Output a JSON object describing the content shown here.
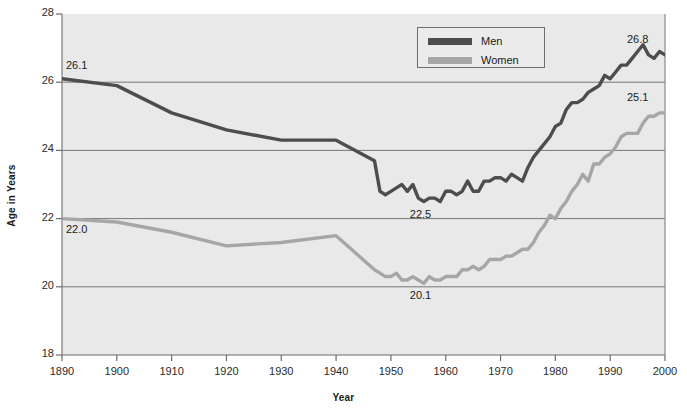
{
  "chart_data": {
    "type": "line",
    "title": "",
    "xlabel": "Year",
    "ylabel": "Age in Years",
    "xlim": [
      1890,
      2000
    ],
    "ylim": [
      18,
      28
    ],
    "grid": true,
    "legend_position": "top-center",
    "xticks": [
      "1890",
      "1900",
      "1910",
      "1920",
      "1930",
      "1940",
      "1950",
      "1960",
      "1970",
      "1980",
      "1990",
      "2000"
    ],
    "yticks": [
      "18",
      "20",
      "22",
      "24",
      "26",
      "28"
    ],
    "annotations": [
      {
        "text": "26.1",
        "x": 1890,
        "y": 26.1,
        "series": "Men"
      },
      {
        "text": "22.5",
        "x": 1956,
        "y": 22.5,
        "series": "Men"
      },
      {
        "text": "26.8",
        "x": 2000,
        "y": 26.8,
        "series": "Men"
      },
      {
        "text": "22.0",
        "x": 1890,
        "y": 22.0,
        "series": "Women"
      },
      {
        "text": "20.1",
        "x": 1956,
        "y": 20.1,
        "series": "Women"
      },
      {
        "text": "25.1",
        "x": 2000,
        "y": 25.1,
        "series": "Women"
      }
    ],
    "x": [
      1890,
      1900,
      1910,
      1920,
      1930,
      1940,
      1947,
      1948,
      1949,
      1950,
      1951,
      1952,
      1953,
      1954,
      1955,
      1956,
      1957,
      1958,
      1959,
      1960,
      1961,
      1962,
      1963,
      1964,
      1965,
      1966,
      1967,
      1968,
      1969,
      1970,
      1971,
      1972,
      1973,
      1974,
      1975,
      1976,
      1977,
      1978,
      1979,
      1980,
      1981,
      1982,
      1983,
      1984,
      1985,
      1986,
      1987,
      1988,
      1989,
      1990,
      1991,
      1992,
      1993,
      1994,
      1995,
      1996,
      1997,
      1998,
      1999,
      2000
    ],
    "series": [
      {
        "name": "Men",
        "color": "#4d4d4d",
        "values": [
          26.1,
          25.9,
          25.1,
          24.6,
          24.3,
          24.3,
          23.7,
          22.8,
          22.7,
          22.8,
          22.9,
          23.0,
          22.8,
          23.0,
          22.6,
          22.5,
          22.6,
          22.6,
          22.5,
          22.8,
          22.8,
          22.7,
          22.8,
          23.1,
          22.8,
          22.8,
          23.1,
          23.1,
          23.2,
          23.2,
          23.1,
          23.3,
          23.2,
          23.1,
          23.5,
          23.8,
          24.0,
          24.2,
          24.4,
          24.7,
          24.8,
          25.2,
          25.4,
          25.4,
          25.5,
          25.7,
          25.8,
          25.9,
          26.2,
          26.1,
          26.3,
          26.5,
          26.5,
          26.7,
          26.9,
          27.1,
          26.8,
          26.7,
          26.9,
          26.8
        ]
      },
      {
        "name": "Women",
        "color": "#a6a6a6",
        "values": [
          22.0,
          21.9,
          21.6,
          21.2,
          21.3,
          21.5,
          20.5,
          20.4,
          20.3,
          20.3,
          20.4,
          20.2,
          20.2,
          20.3,
          20.2,
          20.1,
          20.3,
          20.2,
          20.2,
          20.3,
          20.3,
          20.3,
          20.5,
          20.5,
          20.6,
          20.5,
          20.6,
          20.8,
          20.8,
          20.8,
          20.9,
          20.9,
          21.0,
          21.1,
          21.1,
          21.3,
          21.6,
          21.8,
          22.1,
          22.0,
          22.3,
          22.5,
          22.8,
          23.0,
          23.3,
          23.1,
          23.6,
          23.6,
          23.8,
          23.9,
          24.1,
          24.4,
          24.5,
          24.5,
          24.5,
          24.8,
          25.0,
          25.0,
          25.1,
          25.1
        ]
      }
    ]
  },
  "legend": {
    "items": [
      {
        "label": "Men"
      },
      {
        "label": "Women"
      }
    ]
  }
}
